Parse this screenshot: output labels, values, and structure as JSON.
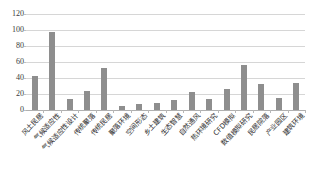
{
  "chart_data": {
    "type": "bar",
    "title": "",
    "xlabel": "",
    "ylabel": "",
    "ylim": [
      0,
      120
    ],
    "ytick_labels": [
      "120",
      "100",
      "80",
      "60",
      "40",
      "20",
      "0"
    ],
    "ytick_values": [
      120,
      100,
      80,
      60,
      40,
      20,
      0
    ],
    "grid": true,
    "legend": "none",
    "bar_color": "#8e8e8e",
    "categories": [
      "风土民居",
      "气候适应性",
      "气候适应性设计",
      "传统聚落",
      "传统民居",
      "聚落环境",
      "空间形态",
      "乡土建筑",
      "生态智慧",
      "自然通风",
      "热环境研究",
      "CFD模拟",
      "数值模拟研究",
      "民居院落",
      "产业园区",
      "建筑环境"
    ],
    "values": [
      43,
      97,
      14,
      24,
      53,
      5,
      7,
      9,
      13,
      22,
      14,
      26,
      56,
      32,
      15,
      34
    ]
  }
}
